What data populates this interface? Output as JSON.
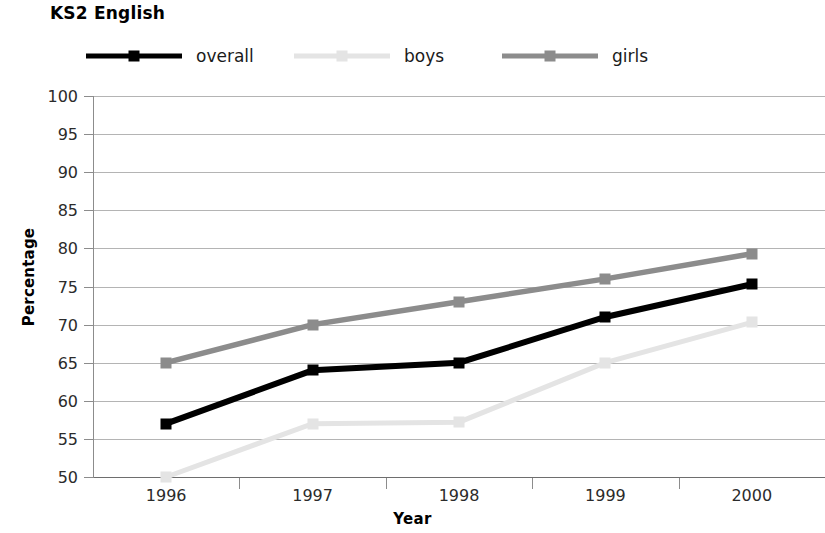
{
  "title": "KS2 English",
  "axis": {
    "y_title": "Percentage",
    "x_title": "Year"
  },
  "legend": {
    "items": [
      {
        "label": "overall",
        "color": "#000000",
        "x": 0
      },
      {
        "label": "boys",
        "color": "#e4e4e4",
        "x": 208
      },
      {
        "label": "girls",
        "color": "#8c8c8c",
        "x": 416
      }
    ]
  },
  "chart_data": {
    "type": "line",
    "title": "KS2 English",
    "xlabel": "Year",
    "ylabel": "Percentage",
    "categories": [
      "1996",
      "1997",
      "1998",
      "1999",
      "2000"
    ],
    "ylim": [
      50,
      100
    ],
    "yticks": [
      50,
      55,
      60,
      65,
      70,
      75,
      80,
      85,
      90,
      95,
      100
    ],
    "grid": true,
    "legend_position": "top",
    "series": [
      {
        "name": "overall",
        "color": "#000000",
        "values": [
          57,
          64,
          65,
          71,
          75.3
        ]
      },
      {
        "name": "boys",
        "color": "#e4e4e4",
        "values": [
          50,
          57,
          57.2,
          65,
          70.3
        ]
      },
      {
        "name": "girls",
        "color": "#8c8c8c",
        "values": [
          65,
          70,
          73,
          76,
          79.3
        ]
      }
    ]
  }
}
